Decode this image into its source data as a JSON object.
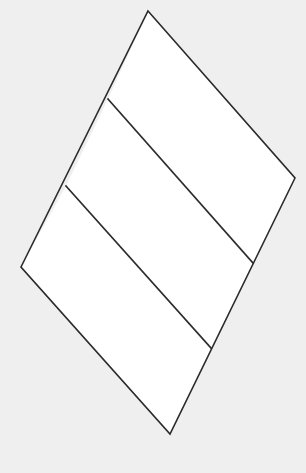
{
  "canvas": {
    "width": 306,
    "height": 473,
    "background_color": "#efefef"
  },
  "figure": {
    "name": "subdivided-quadrilateral",
    "fill_color": "#ffffff",
    "stroke_color": "#2b2b2b",
    "stroke_width": 1.6,
    "vertices": {
      "top": [
        148,
        11
      ],
      "right": [
        295,
        178
      ],
      "bottom": [
        170,
        434
      ],
      "left": [
        21,
        267
      ]
    },
    "outline_path": "M148,11 L295,178 L170,434 L21,267 Z",
    "dividers": [
      {
        "label": "divider-upper",
        "start": [
          108,
          99
        ],
        "end": [
          253,
          263
        ],
        "path": "M108,99 L253,263"
      },
      {
        "label": "divider-lower",
        "start": [
          66,
          186
        ],
        "end": [
          211,
          348
        ],
        "path": "M66,186 L211,348"
      }
    ],
    "bands": [
      {
        "label": "band-top",
        "path": "M148,11 L295,178 L253,263 L108,99 Z"
      },
      {
        "label": "band-middle",
        "path": "M108,99 L253,263 L211,348 L66,186 Z"
      },
      {
        "label": "band-bottom",
        "path": "M66,186 L211,348 L170,434 L21,267 Z"
      }
    ]
  },
  "chart_data": {
    "type": "diagram",
    "title": "",
    "shape": "quadrilateral",
    "subdivisions": 3,
    "labels": [],
    "annotations": []
  }
}
